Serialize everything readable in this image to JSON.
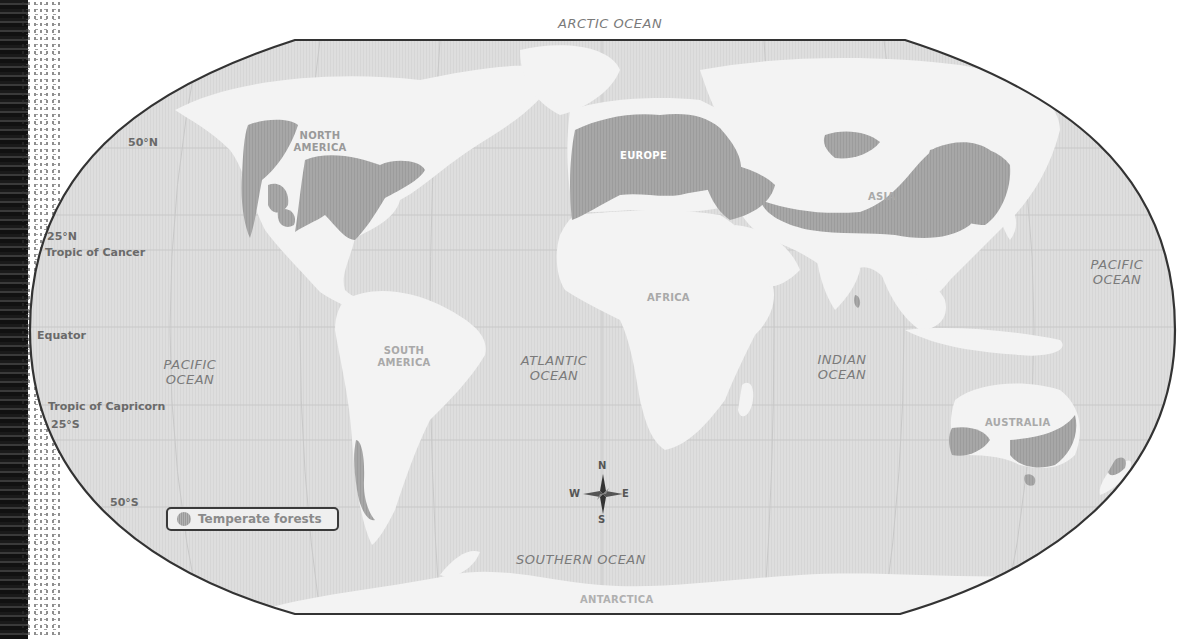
{
  "map": {
    "projection": "Robinson-style world map",
    "oceans": [
      {
        "id": "arctic",
        "label": "ARCTIC OCEAN"
      },
      {
        "id": "pacific-west",
        "label_line1": "PACIFIC",
        "label_line2": "OCEAN"
      },
      {
        "id": "pacific-east",
        "label_line1": "PACIFIC",
        "label_line2": "OCEAN"
      },
      {
        "id": "atlantic",
        "label_line1": "ATLANTIC",
        "label_line2": "OCEAN"
      },
      {
        "id": "indian",
        "label_line1": "INDIAN",
        "label_line2": "OCEAN"
      },
      {
        "id": "southern",
        "label": "SOUTHERN OCEAN"
      }
    ],
    "continents": [
      {
        "id": "north-america",
        "label_line1": "NORTH",
        "label_line2": "AMERICA"
      },
      {
        "id": "south-america",
        "label_line1": "SOUTH",
        "label_line2": "AMERICA"
      },
      {
        "id": "europe",
        "label": "EUROPE"
      },
      {
        "id": "africa",
        "label": "AFRICA"
      },
      {
        "id": "asia",
        "label": "ASIA"
      },
      {
        "id": "australia",
        "label": "AUSTRALIA"
      },
      {
        "id": "antarctica",
        "label": "ANTARCTICA"
      }
    ],
    "latitude_labels": {
      "n50": "50°N",
      "n25": "25°N",
      "tropic_cancer": "Tropic of Cancer",
      "equator": "Equator",
      "tropic_capricorn": "Tropic of Capricorn",
      "s25": "25°S",
      "s50": "50°S"
    },
    "compass": {
      "n": "N",
      "s": "S",
      "e": "E",
      "w": "W"
    },
    "legend": {
      "items": [
        {
          "label": "Temperate forests",
          "color": "#a5a5a5"
        }
      ]
    },
    "colors": {
      "ocean": "#dcdcdc",
      "land": "#f4f4f4",
      "forest": "#a5a5a5",
      "outline": "#333333"
    }
  }
}
